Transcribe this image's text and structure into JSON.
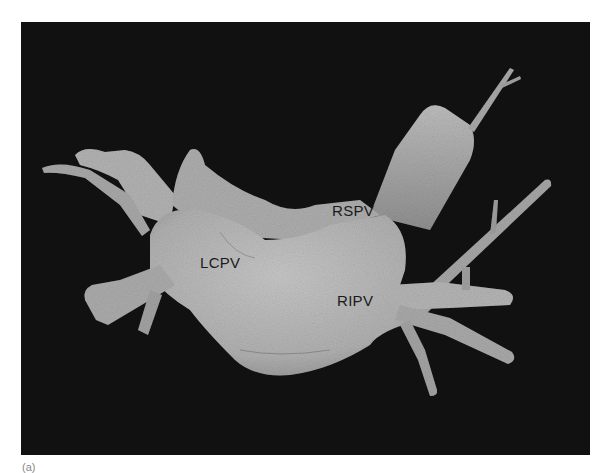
{
  "figure": {
    "panel_letter": "(a)",
    "colors": {
      "background": "#111111",
      "tissue": "#b4b4b4",
      "tissue_highlight": "#c8c8c8",
      "tissue_shadow": "#8a8a8a",
      "label_text": "#1a1a1a",
      "page": "#ffffff"
    },
    "labels": [
      {
        "id": "rspv",
        "text": "RSPV",
        "x": 332,
        "y": 203
      },
      {
        "id": "lcpv",
        "text": "LCPV",
        "x": 200,
        "y": 255
      },
      {
        "id": "ripv",
        "text": "RIPV",
        "x": 337,
        "y": 293
      }
    ]
  }
}
